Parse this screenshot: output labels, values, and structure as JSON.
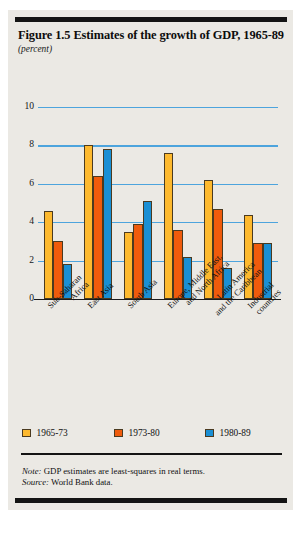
{
  "figure": {
    "title": "Figure 1.5  Estimates of the growth of GDP, 1965-89",
    "units": "(percent)",
    "note_label": "Note:",
    "note_text": " GDP estimates are least-squares in real terms.",
    "source_label": "Source:",
    "source_text": " World Bank data."
  },
  "colors": {
    "series_1965_73": "#fdb92e",
    "series_1973_80": "#ef5b0c",
    "series_1980_89": "#1a8fd4",
    "gridline": "#4da4dd",
    "panel_background": "#ebe9e4",
    "rule": "#141414"
  },
  "chart_data": {
    "type": "bar",
    "title": "Figure 1.5  Estimates of the growth of GDP, 1965-89",
    "subtitle": "",
    "xlabel": "",
    "ylabel": "(percent)",
    "ylim": [
      0,
      10
    ],
    "yticks": [
      0,
      2,
      4,
      6,
      8,
      10
    ],
    "ytick_labels": [
      "0",
      "2",
      "4",
      "6",
      "8",
      "10"
    ],
    "grid": true,
    "legend_position": "bottom",
    "categories": [
      "Sub-Saharan Africa",
      "East Asia",
      "South Asia",
      "Europe, Middle East, and North Africa",
      "Latin America and the Caribbean",
      "Industrial countries"
    ],
    "category_lines": [
      [
        "Sub-Saharan",
        "Africa"
      ],
      [
        "East Asia"
      ],
      [
        "South Asia"
      ],
      [
        "Europe, Middle East,",
        "and North Africa"
      ],
      [
        "Latin America",
        "and the Caribbean"
      ],
      [
        "Industrial",
        "countries"
      ]
    ],
    "series": [
      {
        "name": "1965-73",
        "color": "#fdb92e",
        "values": [
          4.6,
          8.0,
          3.5,
          7.6,
          6.2,
          4.4
        ]
      },
      {
        "name": "1973-80",
        "color": "#ef5b0c",
        "values": [
          3.0,
          6.4,
          3.9,
          3.6,
          4.7,
          2.9
        ]
      },
      {
        "name": "1980-89",
        "color": "#1a8fd4",
        "values": [
          1.8,
          7.8,
          5.1,
          2.2,
          1.6,
          2.9
        ]
      }
    ]
  }
}
